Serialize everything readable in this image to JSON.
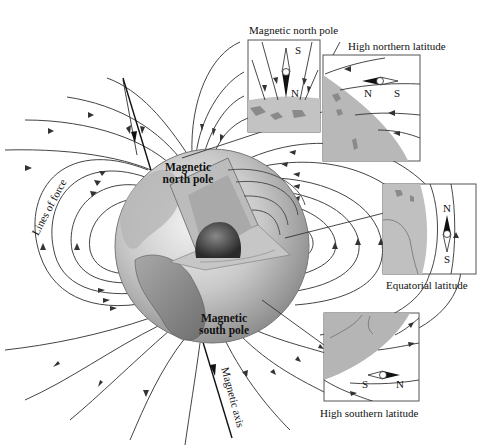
{
  "figure": {
    "background": "#ffffff",
    "line_color": "#333333",
    "globe_color": "#bdbdbd"
  },
  "labels": {
    "magnetic_north_pole_inset": "Magnetic north pole",
    "high_northern_latitude": "High northern latitude",
    "equatorial_latitude": "Equatorial latitude",
    "high_southern_latitude": "High southern latitude",
    "lines_of_force": "Lines of force",
    "magnetic_axis": "Magnetic axis",
    "globe_north_pole_line1": "Magnetic",
    "globe_north_pole_line2": "north pole",
    "globe_south_pole_line1": "Magnetic",
    "globe_south_pole_line2": "south pole"
  },
  "insets": [
    {
      "name": "magnetic-north-pole",
      "compass": {
        "north": "N",
        "south": "S",
        "orientation": "vertical"
      }
    },
    {
      "name": "high-northern-latitude",
      "compass": {
        "north": "N",
        "south": "S",
        "orientation": "horizontal"
      }
    },
    {
      "name": "equatorial-latitude",
      "compass": {
        "north": "N",
        "south": "S",
        "orientation": "vertical"
      }
    },
    {
      "name": "high-southern-latitude",
      "compass": {
        "north": "N",
        "south": "S",
        "orientation": "horizontal"
      }
    }
  ]
}
